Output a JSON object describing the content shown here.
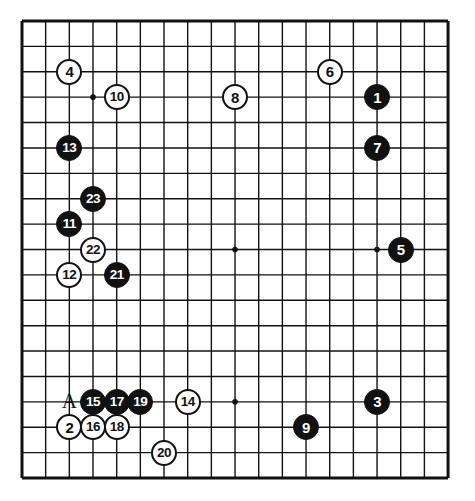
{
  "diagram": {
    "type": "go-board",
    "board_size": 19,
    "geometry": {
      "left": 22,
      "top": 21,
      "col_spacing": 23.67,
      "row_spacing": 25.39,
      "stone_diameter": 26,
      "line_color": "#111111",
      "board_color": "#ffffff",
      "edge_line_width": 3.0,
      "inner_line_width": 1.4
    },
    "star_points": [
      {
        "col": 3,
        "row": 3
      },
      {
        "col": 9,
        "row": 3
      },
      {
        "col": 15,
        "row": 3
      },
      {
        "col": 3,
        "row": 9
      },
      {
        "col": 9,
        "row": 9
      },
      {
        "col": 15,
        "row": 9
      },
      {
        "col": 3,
        "row": 15
      },
      {
        "col": 9,
        "row": 15
      },
      {
        "col": 15,
        "row": 15
      }
    ],
    "stones": [
      {
        "label": "1",
        "color": "black",
        "col": 15,
        "row": 3
      },
      {
        "label": "2",
        "color": "white",
        "col": 2,
        "row": 16
      },
      {
        "label": "3",
        "color": "black",
        "col": 15,
        "row": 15
      },
      {
        "label": "4",
        "color": "white",
        "col": 2,
        "row": 2
      },
      {
        "label": "5",
        "color": "black",
        "col": 16,
        "row": 9
      },
      {
        "label": "6",
        "color": "white",
        "col": 13,
        "row": 2
      },
      {
        "label": "7",
        "color": "black",
        "col": 15,
        "row": 5
      },
      {
        "label": "8",
        "color": "white",
        "col": 9,
        "row": 3
      },
      {
        "label": "9",
        "color": "black",
        "col": 12,
        "row": 16
      },
      {
        "label": "10",
        "color": "white",
        "col": 4,
        "row": 3
      },
      {
        "label": "11",
        "color": "black",
        "col": 2,
        "row": 8
      },
      {
        "label": "12",
        "color": "white",
        "col": 2,
        "row": 10
      },
      {
        "label": "13",
        "color": "black",
        "col": 2,
        "row": 5
      },
      {
        "label": "14",
        "color": "white",
        "col": 7,
        "row": 15
      },
      {
        "label": "15",
        "color": "black",
        "col": 3,
        "row": 15
      },
      {
        "label": "16",
        "color": "white",
        "col": 3,
        "row": 16
      },
      {
        "label": "17",
        "color": "black",
        "col": 4,
        "row": 15
      },
      {
        "label": "18",
        "color": "white",
        "col": 4,
        "row": 16
      },
      {
        "label": "19",
        "color": "black",
        "col": 5,
        "row": 15
      },
      {
        "label": "20",
        "color": "white",
        "col": 6,
        "row": 17
      },
      {
        "label": "21",
        "color": "black",
        "col": 4,
        "row": 10
      },
      {
        "label": "22",
        "color": "white",
        "col": 3,
        "row": 9
      },
      {
        "label": "23",
        "color": "black",
        "col": 3,
        "row": 7
      }
    ],
    "markers": [
      {
        "label": "A",
        "col": 2,
        "row": 15
      }
    ]
  }
}
